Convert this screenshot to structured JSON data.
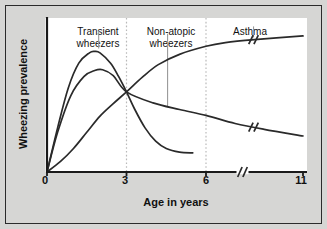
{
  "figure": {
    "background_color": "#d6d6d4",
    "plot_background_color": "#ffffff",
    "frame_color": "#2b2b2b",
    "axis_color": "#1a1a1a",
    "curve_color": "#2a2a2a",
    "gridline_color": "#b9b9b9",
    "leader_color": "#9a9a9a"
  },
  "chart_data": {
    "type": "line",
    "title": "",
    "subtitle": "",
    "xlabel": "Age in years",
    "ylabel": "Wheezing prevalence",
    "xlim": [
      0,
      11
    ],
    "ylim": [
      0,
      1
    ],
    "xticks": [
      "0",
      "3",
      "6",
      "11"
    ],
    "xtick_values": [
      0,
      3,
      6,
      11
    ],
    "yticks": [],
    "grid": "vertical-dotted",
    "gridlines_x": [
      3,
      6
    ],
    "axis_break": {
      "present": true,
      "axis": "x",
      "between": [
        6,
        11
      ],
      "glyph": "//"
    },
    "legend": "none",
    "legend_position": "annotations-inline",
    "series": [
      {
        "name": "Transient wheezers",
        "label": "Transient wheezers",
        "description": "Rises steeply to an early peak near age 1.8, then falls sharply through the age-3 crossing point and flattens to a low plateau, ending near age 5.5",
        "x": [
          0,
          0.4,
          0.8,
          1.2,
          1.6,
          1.8,
          2.0,
          2.4,
          2.7,
          3.0,
          3.3,
          3.7,
          4.1,
          4.5,
          5.0,
          5.5
        ],
        "y": [
          0.0,
          0.3,
          0.57,
          0.74,
          0.81,
          0.82,
          0.81,
          0.74,
          0.65,
          0.545,
          0.43,
          0.3,
          0.21,
          0.16,
          0.135,
          0.13
        ],
        "ends_at": 5.5,
        "has_axis_break": false
      },
      {
        "name": "Non-atopic wheezers",
        "label": "Non-atopic wheezers",
        "description": "Rises to a modest peak near age 2.1, then declines slowly and almost linearly through the age-3 crossing point all the way to age 11",
        "x": [
          0,
          0.4,
          0.9,
          1.4,
          1.8,
          2.1,
          2.5,
          3.0,
          4.0,
          5.0,
          6.0,
          7.5,
          9.0,
          11.0
        ],
        "y": [
          0.0,
          0.27,
          0.52,
          0.65,
          0.69,
          0.695,
          0.655,
          0.545,
          0.47,
          0.425,
          0.385,
          0.33,
          0.29,
          0.245
        ],
        "ends_at": 11,
        "has_axis_break": true
      },
      {
        "name": "Asthma",
        "label": "Asthma",
        "description": "Rises slowly and steadily, crosses the other curves at age 3, continues climbing and plateaus after age 6, reaching the highest level by age 11",
        "x": [
          0,
          0.5,
          1.0,
          1.5,
          2.0,
          2.5,
          3.0,
          3.6,
          4.2,
          5.0,
          6.0,
          7.0,
          8.5,
          11.0
        ],
        "y": [
          0.0,
          0.07,
          0.16,
          0.27,
          0.38,
          0.465,
          0.545,
          0.645,
          0.73,
          0.8,
          0.855,
          0.88,
          0.9,
          0.925
        ],
        "ends_at": 11,
        "has_axis_break": true
      }
    ],
    "crossing_point": {
      "x": 3,
      "y": 0.545,
      "note": "all three curves intersect at age 3"
    },
    "annotations": [
      {
        "text_line1": "Transient",
        "text_line2": "wheezers",
        "target_series": "Transient wheezers",
        "leader_from": {
          "x": 1.95,
          "y": 0.96
        },
        "leader_to": {
          "x": 1.95,
          "y": 0.84
        }
      },
      {
        "text_line1": "Non-atopic",
        "text_line2": "wheezers",
        "target_series": "Non-atopic wheezers",
        "leader_from": {
          "x": 4.55,
          "y": 0.94
        },
        "leader_to": {
          "x": 4.55,
          "y": 0.445
        }
      },
      {
        "text_line1": "Asthma",
        "text_line2": "",
        "target_series": "Asthma",
        "leader_from": {
          "x": 8.45,
          "y": 0.99
        },
        "leader_to": {
          "x": 8.45,
          "y": 0.915
        }
      }
    ]
  }
}
